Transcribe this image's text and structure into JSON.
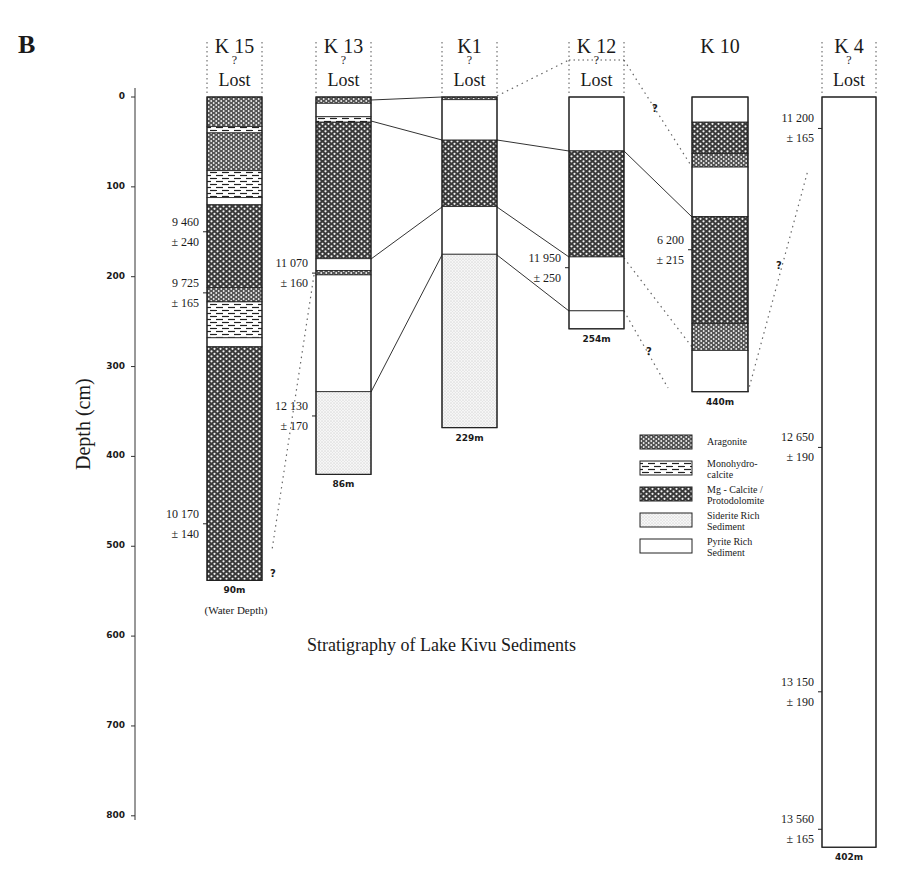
{
  "panel_label": "B",
  "title": "Stratigraphy of Lake Kivu Sediments",
  "axis": {
    "label": "Depth  (cm)",
    "ticks": [
      "0",
      "100",
      "200",
      "300",
      "400",
      "500",
      "600",
      "700",
      "800"
    ]
  },
  "lost_label": "Lost",
  "question_mark": "?",
  "water_depth_caption": "(Water Depth)",
  "legend": [
    {
      "key": "aragonite",
      "label": "Aragonite"
    },
    {
      "key": "monohydrocalcite",
      "label": "Monohydro-\ncalcite"
    },
    {
      "key": "mgcalcite",
      "label": "Mg - Calcite /\nProtodolomite"
    },
    {
      "key": "siderite",
      "label": "Siderite Rich\nSediment"
    },
    {
      "key": "pyrite",
      "label": "Pyrite Rich\nSediment"
    }
  ],
  "cores": [
    {
      "name": "K 15",
      "water_depth": "90m",
      "dates": [
        {
          "age": "9 460",
          "err": "± 240",
          "depth": 150
        },
        {
          "age": "9 725",
          "err": "± 165",
          "depth": 218
        },
        {
          "age": "10 170",
          "err": "± 140",
          "depth": 475
        }
      ]
    },
    {
      "name": "K 13",
      "water_depth": "86m",
      "dates": [
        {
          "age": "11 070",
          "err": "± 160",
          "depth": 196
        },
        {
          "age": "12 130",
          "err": "± 170",
          "depth": 355
        }
      ]
    },
    {
      "name": "K1",
      "water_depth": "229m",
      "dates": []
    },
    {
      "name": "K 12",
      "water_depth": "254m",
      "dates": [
        {
          "age": "11 950",
          "err": "± 250",
          "depth": 190
        }
      ]
    },
    {
      "name": "K 10",
      "water_depth": "440m",
      "dates": [
        {
          "age": "6 200",
          "err": "± 215",
          "depth": 170
        }
      ]
    },
    {
      "name": "K 4",
      "water_depth": "402m",
      "dates": [
        {
          "age": "11 200",
          "err": "± 165",
          "depth": 35
        },
        {
          "age": "12 650",
          "err": "± 190",
          "depth": 390
        },
        {
          "age": "13 150",
          "err": "± 190",
          "depth": 662
        },
        {
          "age": "13 560",
          "err": "± 165",
          "depth": 815
        }
      ]
    }
  ],
  "chart_data": {
    "type": "table",
    "title": "Stratigraphy of Lake Kivu Sediments",
    "ylabel": "Depth (cm)",
    "ylim": [
      0,
      800
    ],
    "legend": [
      "Aragonite",
      "Monohydrocalcite",
      "Mg-Calcite / Protodolomite",
      "Siderite Rich Sediment",
      "Pyrite Rich Sediment"
    ],
    "cores": [
      {
        "core": "K 15",
        "water_depth_m": 90,
        "total_depth_cm": 538,
        "layers": [
          [
            "aragonite",
            0,
            33
          ],
          [
            "monohydrocalcite",
            33,
            40
          ],
          [
            "aragonite",
            40,
            82
          ],
          [
            "monohydrocalcite",
            82,
            112
          ],
          [
            "pyrite",
            112,
            120
          ],
          [
            "mgcalcite",
            120,
            212
          ],
          [
            "aragonite",
            212,
            228
          ],
          [
            "monohydrocalcite",
            228,
            268
          ],
          [
            "pyrite",
            268,
            278
          ],
          [
            "mgcalcite",
            278,
            538
          ]
        ],
        "radiocarbon": [
          [
            "9 460 ± 240",
            150
          ],
          [
            "9 725 ± 165",
            218
          ],
          [
            "10 170 ± 140",
            475
          ]
        ]
      },
      {
        "core": "K 13",
        "water_depth_m": 86,
        "total_depth_cm": 420,
        "layers": [
          [
            "aragonite",
            0,
            7
          ],
          [
            "pyrite",
            7,
            22
          ],
          [
            "monohydrocalcite",
            22,
            28
          ],
          [
            "mgcalcite",
            28,
            180
          ],
          [
            "pyrite",
            180,
            193
          ],
          [
            "aragonite",
            193,
            198
          ],
          [
            "pyrite",
            198,
            328
          ],
          [
            "siderite",
            328,
            420
          ]
        ],
        "radiocarbon": [
          [
            "11 070 ± 160",
            196
          ],
          [
            "12 130 ± 170",
            355
          ]
        ]
      },
      {
        "core": "K1",
        "water_depth_m": 229,
        "total_depth_cm": 368,
        "layers": [
          [
            "aragonite",
            0,
            3
          ],
          [
            "pyrite",
            3,
            48
          ],
          [
            "mgcalcite",
            48,
            122
          ],
          [
            "pyrite",
            122,
            175
          ],
          [
            "siderite",
            175,
            368
          ]
        ],
        "radiocarbon": []
      },
      {
        "core": "K 12",
        "water_depth_m": 254,
        "total_depth_cm": 258,
        "layers": [
          [
            "pyrite",
            0,
            60
          ],
          [
            "mgcalcite",
            60,
            178
          ],
          [
            "pyrite",
            178,
            238
          ],
          [
            "pyrite",
            238,
            258
          ]
        ],
        "radiocarbon": [
          [
            "11 950 ± 250",
            190
          ]
        ]
      },
      {
        "core": "K 10",
        "water_depth_m": 440,
        "total_depth_cm": 328,
        "layers": [
          [
            "pyrite",
            0,
            28
          ],
          [
            "mgcalcite",
            28,
            63
          ],
          [
            "aragonite",
            63,
            78
          ],
          [
            "pyrite",
            78,
            133
          ],
          [
            "mgcalcite",
            133,
            252
          ],
          [
            "aragonite",
            252,
            282
          ],
          [
            "pyrite",
            282,
            328
          ]
        ],
        "radiocarbon": [
          [
            "6 200 ± 215",
            170
          ]
        ]
      },
      {
        "core": "K 4",
        "water_depth_m": 402,
        "total_depth_cm": 835,
        "layers": [
          [
            "pyrite",
            0,
            835
          ]
        ],
        "radiocarbon": [
          [
            "11 200 ± 165",
            35
          ],
          [
            "12 650 ± 190",
            390
          ],
          [
            "13 150 ± 190",
            662
          ],
          [
            "13 560 ± 165",
            815
          ]
        ]
      }
    ]
  }
}
